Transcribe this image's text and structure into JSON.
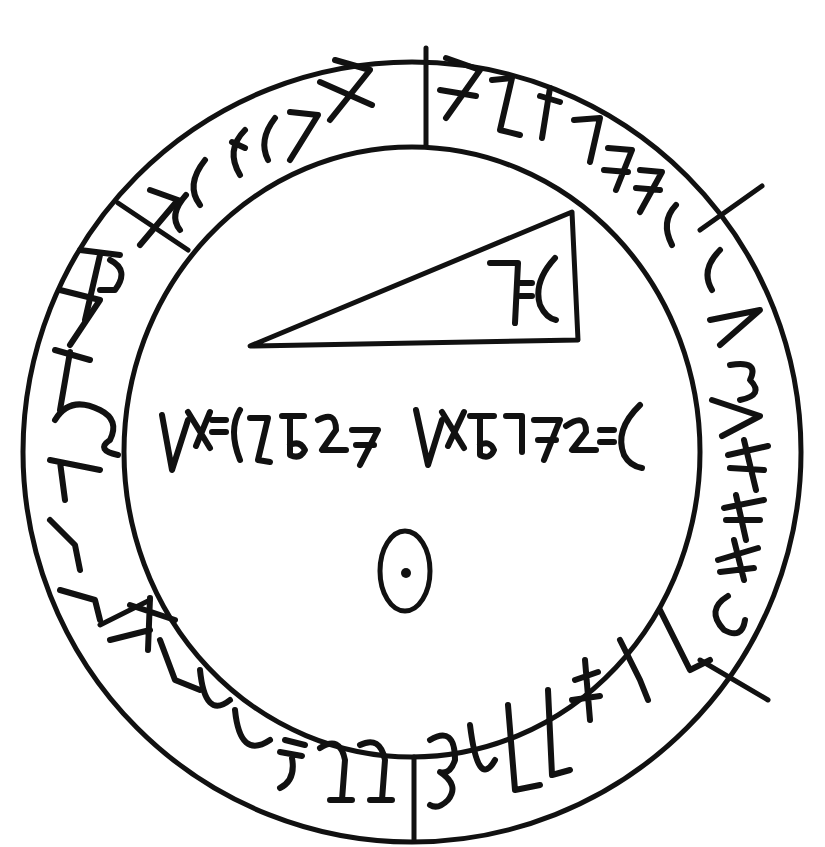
{
  "diagram": {
    "type": "circular-seal",
    "colors": {
      "ink": "#111111",
      "background": "#ffffff"
    },
    "outer_ring": {
      "segments": [
        {
          "id": "top-left",
          "glyphs": "7ℇ(ℇ(77X"
        },
        {
          "id": "top-right",
          "glyphs": "X2+ℒ77ℇ("
        },
        {
          "id": "right-upper",
          "glyphs": "ℇ(V3V"
        },
        {
          "id": "right-lower",
          "glyphs": "7≠≠ℒ"
        },
        {
          "id": "bottom-right",
          "glyphs": "3ULL≠7L"
        },
        {
          "id": "bottom-left",
          "glyphs": "≠LUU≠99"
        },
        {
          "id": "left",
          "glyphs": "L77ℒL7P"
        }
      ]
    },
    "triangle": {
      "label": "7ℇ("
    },
    "center_inscription": {
      "word1": "V≠ℇ(L6L7",
      "word2": "V≠6772ℇ("
    },
    "center_symbol": "circumpunct-icon"
  }
}
